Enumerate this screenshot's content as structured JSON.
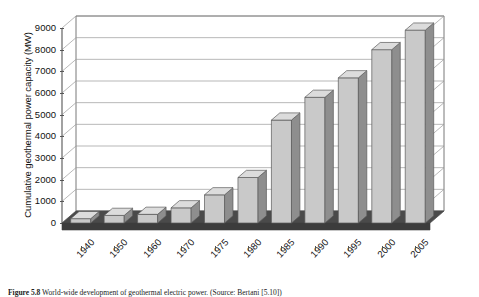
{
  "chart_data": {
    "type": "bar",
    "title": "",
    "xlabel": "",
    "ylabel": "Cumulative geothermal power capacity (MW)",
    "categories": [
      "1940",
      "1950",
      "1960",
      "1970",
      "1975",
      "1980",
      "1985",
      "1990",
      "1995",
      "2000",
      "2005"
    ],
    "values": [
      200,
      350,
      400,
      700,
      1300,
      2100,
      4750,
      5800,
      6700,
      8000,
      8900
    ],
    "ylim": [
      0,
      9000
    ],
    "yticks": [
      0,
      1000,
      2000,
      3000,
      4000,
      5000,
      6000,
      7000,
      8000,
      9000
    ],
    "ytick_labels": [
      "0",
      "1000",
      "2000",
      "3000",
      "4000",
      "5000",
      "6000",
      "7000",
      "8000",
      "9000"
    ],
    "grid": true,
    "legend": false,
    "legend_position": "none",
    "style": "3d-column",
    "colors": {
      "bar_face": "#c9c9c9",
      "bar_side": "#8e8e8e",
      "bar_top": "#dcdcdc",
      "bar_edge": "#5a5a5a",
      "floor": "#4a4a4a",
      "floor_front": "#3c3c3c",
      "grid": "#9a9a9a",
      "axis": "#555555",
      "plot_background": "#ffffff",
      "text": "#111111"
    }
  },
  "axis": {
    "y_title": "Cumulative geothermal power capacity (MW)"
  },
  "caption": {
    "figure_number": "Figure 5.8",
    "text": "World-wide development of geothermal electric power. (Source: Bertani [5.10])"
  }
}
